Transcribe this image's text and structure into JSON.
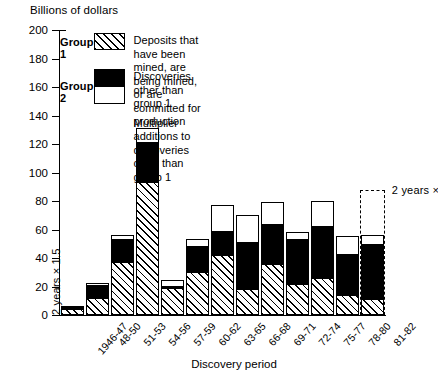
{
  "axis_title_y": "Billions of dollars",
  "axis_title_x": "Discovery period",
  "legend": {
    "group1_name": "Group 1",
    "group2_name": "Group 2",
    "group1_desc": "Deposits that have been mined, are being mined, or are committed for production",
    "group2a_desc": "Discoveries other than group 1",
    "group2b_desc": "Multiplier additions to discoveries other than group 1"
  },
  "annotations": {
    "projection_note": "2 years × 1.5",
    "inplot_note": "2 years × 1.5"
  },
  "chart_data": {
    "type": "bar",
    "stacked": true,
    "title": "",
    "xlabel": "Discovery period",
    "ylabel": "Billions of dollars",
    "ylim": [
      0,
      200
    ],
    "ytick_step": 20,
    "yticks": [
      0,
      20,
      40,
      60,
      80,
      100,
      120,
      140,
      160,
      180,
      200
    ],
    "grid": false,
    "legend_position": "inside-top-left",
    "categories": [
      "1946-47",
      "48-50",
      "51-53",
      "54-56",
      "57-59",
      "60-62",
      "63-65",
      "66-68",
      "69-71",
      "72-74",
      "75-77",
      "78-80",
      "81-82"
    ],
    "series": [
      {
        "name": "Deposits that have been mined, are being mined, or are committed for production",
        "short_name": "Group 1",
        "fill": "hatched",
        "values": [
          4,
          12,
          37,
          93,
          19,
          30,
          42,
          18,
          36,
          22,
          26,
          14,
          11
        ]
      },
      {
        "name": "Discoveries other than group 1",
        "short_name": "Group 2 - discoveries",
        "fill": "black",
        "values": [
          3,
          10,
          17,
          29,
          2,
          19,
          18,
          34,
          29,
          32,
          37,
          30,
          40
        ]
      },
      {
        "name": "Multiplier additions to discoveries other than group 1",
        "short_name": "Group 2 - multiplier additions",
        "fill": "white",
        "values": [
          0,
          2,
          4,
          11,
          5,
          6,
          19,
          20,
          16,
          6,
          19,
          13,
          7
        ]
      }
    ],
    "totals": [
      7,
      24,
      58,
      133,
      26,
      55,
      79,
      72,
      81,
      60,
      82,
      57,
      58
    ],
    "projection": {
      "category": "81-82",
      "note": "2 years × 1.5",
      "top_value": 88,
      "style": "dashed-outline"
    },
    "inplot_annotation": {
      "category": "1946-47",
      "note": "2 years × 1.5",
      "orientation": "vertical"
    }
  }
}
